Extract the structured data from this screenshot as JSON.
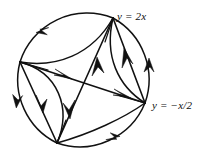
{
  "figure": {
    "type": "phase-portrait",
    "background_color": "#ffffff",
    "stroke_color": "#111111",
    "labels": {
      "top": "y = 2x",
      "right": "y = −x/2"
    },
    "circle": {
      "cx": 84.5,
      "cy": 80,
      "r": 70.5,
      "stroke_width": 1.5
    },
    "vertices": [
      {
        "name": "top-vertex",
        "x": 113,
        "y": 18
      },
      {
        "name": "right-vertex",
        "x": 145,
        "y": 103
      },
      {
        "name": "bottom-vertex",
        "x": 57,
        "y": 143
      },
      {
        "name": "left-vertex",
        "x": 20,
        "y": 62
      }
    ],
    "circle_arcs": [
      {
        "name": "arc-left-to-top",
        "from": "left-vertex",
        "to": "top-vertex",
        "arrow_at": 0.45,
        "direction": "forward"
      },
      {
        "name": "arc-top-to-right",
        "from": "top-vertex",
        "to": "right-vertex",
        "arrow_at": 0.62,
        "direction": "backward"
      },
      {
        "name": "arc-right-to-bottom",
        "from": "right-vertex",
        "to": "bottom-vertex",
        "arrow_at": 0.48,
        "direction": "forward"
      },
      {
        "name": "arc-bottom-to-left",
        "from": "bottom-vertex",
        "to": "left-vertex",
        "arrow_at": 0.55,
        "direction": "forward"
      }
    ],
    "chords": [
      {
        "name": "chord-left-to-right",
        "from": "left-vertex",
        "to": "right-vertex",
        "arrows": 2
      },
      {
        "name": "chord-bottom-to-top",
        "from": "bottom-vertex",
        "to": "top-vertex",
        "arrows": 2
      },
      {
        "name": "chord-left-to-bottom",
        "from": "left-vertex",
        "to": "bottom-vertex",
        "arrows": 1
      },
      {
        "name": "chord-top-to-right",
        "from": "top-vertex",
        "to": "right-vertex",
        "arrows": 1
      }
    ],
    "inner_curves": [
      {
        "name": "curve-left-top-inner",
        "bulge": "down-right"
      },
      {
        "name": "curve-left-bottom-inner",
        "bulge": "right"
      },
      {
        "name": "curve-top-right-inner",
        "bulge": "left"
      },
      {
        "name": "curve-bottom-right-inner",
        "bulge": "up"
      }
    ]
  }
}
